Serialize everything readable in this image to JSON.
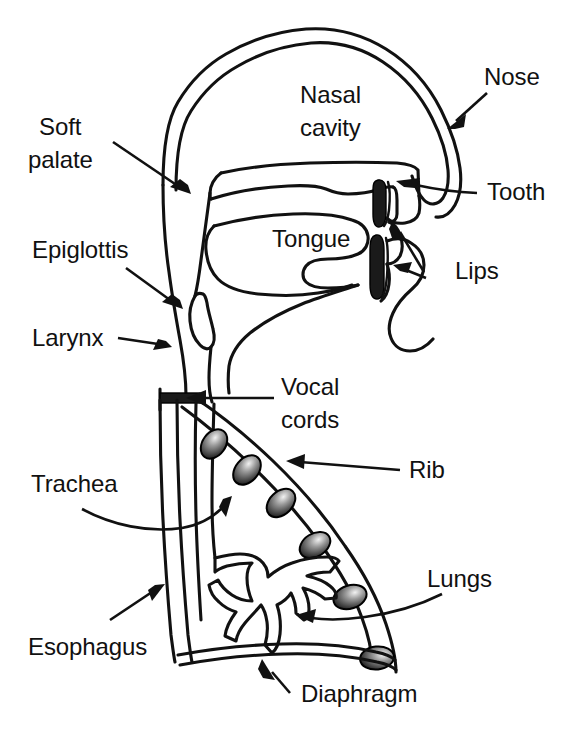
{
  "figure": {
    "kind": "anatomical-diagram",
    "background_color": "#ffffff",
    "line_color": "#111111",
    "width": 574,
    "height": 735
  },
  "labels": {
    "nose": "Nose",
    "nasal_cavity_line1": "Nasal",
    "nasal_cavity_line2": "cavity",
    "soft_palate_line1": "Soft",
    "soft_palate_line2": "palate",
    "tooth": "Tooth",
    "tongue": "Tongue",
    "lips": "Lips",
    "epiglottis": "Epiglottis",
    "larynx": "Larynx",
    "vocal_cords_line1": "Vocal",
    "vocal_cords_line2": "cords",
    "rib": "Rib",
    "trachea": "Trachea",
    "lungs": "Lungs",
    "esophagus": "Esophagus",
    "diaphragm": "Diaphragm"
  },
  "parts": [
    {
      "id": "nose",
      "label": "Nose",
      "side": "right"
    },
    {
      "id": "nasal-cavity",
      "label": "Nasal cavity",
      "side": "inline"
    },
    {
      "id": "soft-palate",
      "label": "Soft palate",
      "side": "left"
    },
    {
      "id": "tooth",
      "label": "Tooth",
      "side": "right"
    },
    {
      "id": "tongue",
      "label": "Tongue",
      "side": "inline"
    },
    {
      "id": "lips",
      "label": "Lips",
      "side": "right"
    },
    {
      "id": "epiglottis",
      "label": "Epiglottis",
      "side": "left"
    },
    {
      "id": "larynx",
      "label": "Larynx",
      "side": "left"
    },
    {
      "id": "vocal-cords",
      "label": "Vocal cords",
      "side": "right"
    },
    {
      "id": "rib",
      "label": "Rib",
      "side": "right"
    },
    {
      "id": "trachea",
      "label": "Trachea",
      "side": "left"
    },
    {
      "id": "lungs",
      "label": "Lungs",
      "side": "right"
    },
    {
      "id": "esophagus",
      "label": "Esophagus",
      "side": "left"
    },
    {
      "id": "diaphragm",
      "label": "Diaphragm",
      "side": "bottom"
    }
  ],
  "counts": {
    "ribs": 6,
    "teeth_marks": 2
  }
}
